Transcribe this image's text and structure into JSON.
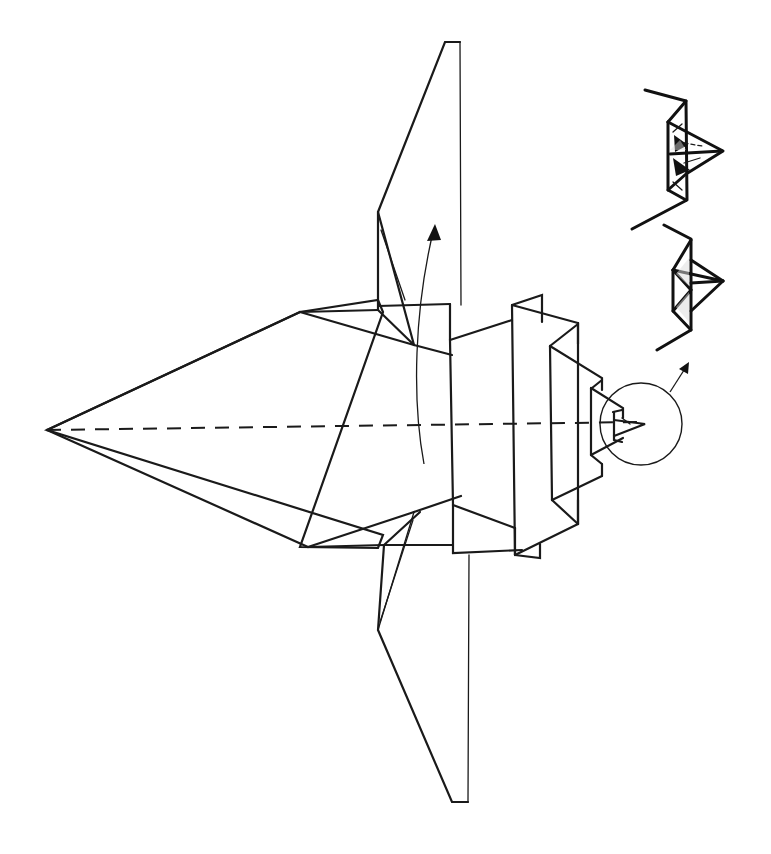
{
  "diagram": {
    "type": "origami-instruction-step",
    "background_color": "#ffffff",
    "line_color": "#1a1a1a",
    "canvas": {
      "width": 771,
      "height": 854
    },
    "fold_line": {
      "kind": "valley-fold-dashed",
      "from": [
        47,
        430
      ],
      "to": [
        640,
        422
      ]
    },
    "curved_arrow": {
      "meaning": "fold wing/flap upward along dashed line",
      "path": "M 424 464 C 412 400, 414 310, 434 228",
      "head": [
        [
          434,
          224
        ],
        [
          428,
          240
        ],
        [
          440,
          238
        ]
      ]
    },
    "detail_circle": {
      "meaning": "magnified detail of tail/tip",
      "cx": 641,
      "cy": 424,
      "r": 41
    },
    "detail_arrow": {
      "meaning": "points to inset detail drawings",
      "path": "M 670 392 L 687 366",
      "head": [
        [
          688,
          363
        ],
        [
          680,
          370
        ],
        [
          689,
          372
        ]
      ]
    },
    "insets": [
      {
        "id": "inset-top",
        "label": "detail step A (with reverse-fold arrows)"
      },
      {
        "id": "inset-bottom",
        "label": "detail step B (result)"
      }
    ]
  }
}
